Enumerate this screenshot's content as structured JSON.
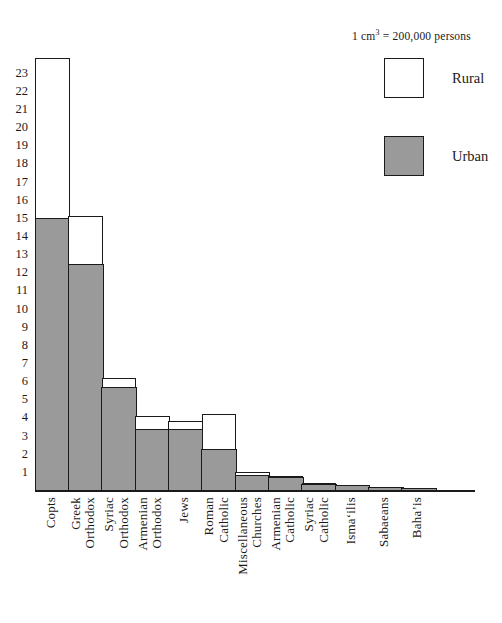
{
  "legend": {
    "caption_prefix": "1 cm",
    "caption_sup": "3",
    "caption_suffix": " = 200,000 persons",
    "caption_full": "1 cm³ = 200,000 persons",
    "rural_label": "Rural",
    "urban_label": "Urban",
    "rural_color": "#ffffff",
    "urban_color": "#9a9a9a",
    "outline_color": "#1a1a1a"
  },
  "chart_data": {
    "type": "bar",
    "title": "",
    "subtitle": "",
    "xlabel": "",
    "ylabel": "",
    "stacked": true,
    "grid": false,
    "legend_position": "top-right",
    "unit_note": "1 cm³ = 200,000 persons",
    "ylim": [
      0,
      24
    ],
    "yticks": [
      23,
      22,
      21,
      20,
      19,
      18,
      17,
      16,
      15,
      14,
      13,
      12,
      11,
      10,
      9,
      8,
      7,
      6,
      5,
      4,
      3,
      2,
      1
    ],
    "categories": [
      "Copts",
      "Greek Orthodox",
      "Syriac Orthodox",
      "Armenian Orthodox",
      "Jews",
      "Roman Catholic",
      "Miscellaneous Churches",
      "Armenian Catholic",
      "Syriac Catholic",
      "Isma'ilis",
      "Sabaeans",
      "Baha'is"
    ],
    "category_lines": [
      [
        "Copts"
      ],
      [
        "Greek",
        "Orthodox"
      ],
      [
        "Syriac",
        "Orthodox"
      ],
      [
        "Armenian",
        "Orthodox"
      ],
      [
        "Jews"
      ],
      [
        "Roman",
        "Catholic"
      ],
      [
        "Miscellaneous",
        "Churches"
      ],
      [
        "Armenian",
        "Catholic"
      ],
      [
        "Syriac",
        "Catholic"
      ],
      [
        "Isma‘ilis"
      ],
      [
        "Sabaeans"
      ],
      [
        "Baha’is"
      ]
    ],
    "series": [
      {
        "name": "Urban",
        "color": "#9a9a9a",
        "values": [
          15.0,
          12.5,
          5.7,
          3.4,
          3.4,
          2.3,
          0.85,
          0.75,
          0.35,
          0.3,
          0.18,
          0.12
        ]
      },
      {
        "name": "Rural",
        "color": "#ffffff",
        "values": [
          8.8,
          2.6,
          0.5,
          0.7,
          0.4,
          1.9,
          0.15,
          0.05,
          0.05,
          0.0,
          0.0,
          0.0
        ]
      }
    ],
    "totals": [
      23.8,
      15.1,
      6.2,
      4.1,
      3.8,
      4.2,
      1.0,
      0.8,
      0.4,
      0.3,
      0.18,
      0.12
    ]
  }
}
